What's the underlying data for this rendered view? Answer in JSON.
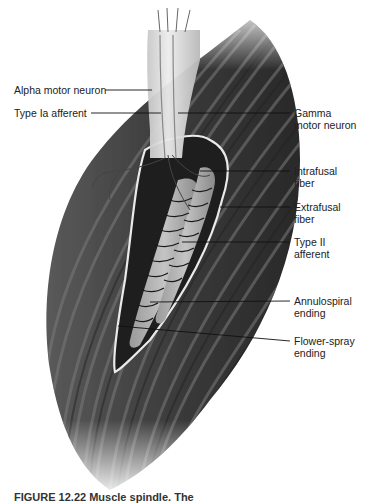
{
  "figure": {
    "title": "Muscle spindle",
    "caption": "FIGURE 12.22 Muscle spindle. The",
    "colors": {
      "background": "#ffffff",
      "muscle_dark": "#3a3a3a",
      "muscle_light": "#8a8a8a",
      "nerve_bundle": "#d8d8d8",
      "capsule_outline": "#e8e8e8",
      "label_text": "#222222",
      "leader_line": "#111111"
    }
  },
  "labels": {
    "alpha_motor_neuron": "Alpha motor neuron",
    "type_ia_afferent": "Type Ia afferent",
    "gamma_motor_neuron": "Gamma\nmotor neuron",
    "intrafusal_fiber": "Intrafusal\nfiber",
    "extrafusal_fiber": "Extrafusal\nfiber",
    "type_ii_afferent": "Type II\nafferent",
    "annulospiral_ending": "Annulospiral\nending",
    "flower_spray_ending": "Flower-spray\nending"
  }
}
